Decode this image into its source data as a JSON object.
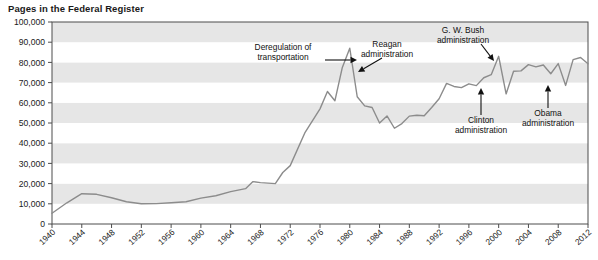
{
  "chart_data": {
    "type": "line",
    "title": "Pages in the Federal Register",
    "xlabel": "",
    "ylabel": "",
    "xlim": [
      1940,
      2012
    ],
    "ylim": [
      0,
      100000
    ],
    "grid": "horizontal-bands",
    "legend": "none",
    "y_ticks": [
      0,
      10000,
      20000,
      30000,
      40000,
      50000,
      60000,
      70000,
      80000,
      90000,
      100000
    ],
    "y_tick_labels": [
      "0",
      "10,000",
      "20,000",
      "30,000",
      "40,000",
      "50,000",
      "60,000",
      "70,000",
      "80,000",
      "90,000",
      "100,000"
    ],
    "x_ticks": [
      1940,
      1944,
      1948,
      1952,
      1956,
      1960,
      1964,
      1968,
      1972,
      1976,
      1980,
      1984,
      1988,
      1992,
      1996,
      2000,
      2004,
      2008,
      2012
    ],
    "x_tick_labels": [
      "1940",
      "1944",
      "1948",
      "1952",
      "1956",
      "1960",
      "1964",
      "1968",
      "1972",
      "1976",
      "1980",
      "1984",
      "1988",
      "1992",
      "1996",
      "2000",
      "2004",
      "2008",
      "2012"
    ],
    "series_name": "Pages in the Federal Register",
    "line_color": "#8c8c8c",
    "x": [
      1940,
      1942,
      1944,
      1946,
      1948,
      1950,
      1952,
      1954,
      1956,
      1958,
      1960,
      1962,
      1964,
      1966,
      1967,
      1968,
      1970,
      1971,
      1972,
      1974,
      1976,
      1977,
      1978,
      1979,
      1980,
      1981,
      1982,
      1983,
      1984,
      1985,
      1986,
      1987,
      1988,
      1989,
      1990,
      1991,
      1992,
      1993,
      1994,
      1995,
      1996,
      1997,
      1998,
      1999,
      2000,
      2001,
      2002,
      2003,
      2004,
      2005,
      2006,
      2007,
      2008,
      2009,
      2010,
      2011,
      2012
    ],
    "values": [
      5300,
      10500,
      15000,
      14700,
      13000,
      11000,
      10000,
      10100,
      10500,
      11000,
      12800,
      14000,
      16000,
      17500,
      21000,
      20500,
      20000,
      25500,
      28900,
      45400,
      57000,
      65600,
      61000,
      77500,
      87000,
      63000,
      58500,
      57700,
      50000,
      53500,
      47400,
      49700,
      53400,
      53800,
      53600,
      57700,
      62000,
      69600,
      68100,
      67500,
      69400,
      68500,
      72400,
      73900,
      83000,
      64400,
      75600,
      75800,
      78900,
      77800,
      78700,
      74400,
      79400,
      68600,
      81400,
      82400,
      79300
    ],
    "peak_annotations": [
      {
        "label": "1980 peak",
        "year": 1980,
        "value": 87000
      },
      {
        "label": "2000 peak",
        "year": 2000,
        "value": 83000
      }
    ],
    "annotations": [
      {
        "name": "deregulation-of-transportation",
        "line1": "Deregulation of",
        "line2": "transportation",
        "arrow": "right",
        "points_to_year": 1980,
        "points_to_value": 87000
      },
      {
        "name": "reagan-administration",
        "line1": "Reagan",
        "line2": "administration",
        "arrow": "down-left",
        "points_to_year": 1981,
        "points_to_value": 70000
      },
      {
        "name": "gw-bush-administration",
        "line1": "G. W. Bush",
        "line2": "administration",
        "arrow": "down-right",
        "points_to_year": 2001,
        "points_to_value": 83000
      },
      {
        "name": "clinton-administration",
        "line1": "Clinton",
        "line2": "administration",
        "arrow": "up",
        "points_to_year": 1993,
        "points_to_value": 62000
      },
      {
        "name": "obama-administration",
        "line1": "Obama",
        "line2": "administration",
        "arrow": "up",
        "points_to_year": 2009,
        "points_to_value": 68600
      }
    ]
  }
}
